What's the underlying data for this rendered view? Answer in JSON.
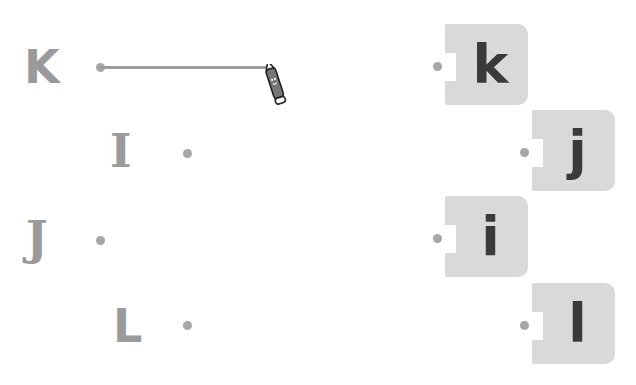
{
  "game": {
    "type": "matching-lines",
    "instruction_visible": false
  },
  "left_items": [
    {
      "letter": "K",
      "id": "K"
    },
    {
      "letter": "I",
      "id": "I"
    },
    {
      "letter": "J",
      "id": "J"
    },
    {
      "letter": "L",
      "id": "L"
    }
  ],
  "right_items": [
    {
      "letter": "k",
      "id": "k"
    },
    {
      "letter": "j",
      "id": "j"
    },
    {
      "letter": "i",
      "id": "i"
    },
    {
      "letter": "l",
      "id": "l"
    }
  ],
  "drawing": {
    "from": "K",
    "in_progress": true,
    "tool": "pencil-icon"
  },
  "colors": {
    "uppercase": "#9a9a9a",
    "lowercase": "#3a3a3a",
    "card": "#d9d9d9",
    "dot": "#a6a6a6",
    "line": "#9c9c9c"
  }
}
